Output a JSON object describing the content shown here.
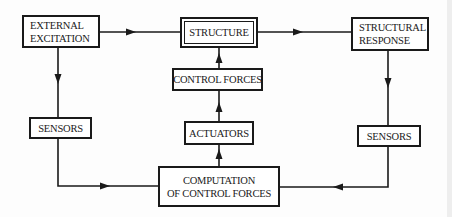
{
  "diagram": {
    "type": "block-diagram",
    "title": "",
    "nodes": {
      "external_excitation": {
        "lines": [
          "EXTERNAL",
          "EXCITATION"
        ]
      },
      "structure": {
        "lines": [
          "STRUCTURE"
        ],
        "style": "double-border"
      },
      "structural_response": {
        "lines": [
          "STRUCTURAL",
          "RESPONSE"
        ]
      },
      "control_forces": {
        "lines": [
          "CONTROL FORCES"
        ]
      },
      "actuators": {
        "lines": [
          "ACTUATORS"
        ]
      },
      "computation": {
        "lines": [
          "COMPUTATION",
          "OF CONTROL FORCES"
        ]
      },
      "sensors_left": {
        "lines": [
          "SENSORS"
        ]
      },
      "sensors_right": {
        "lines": [
          "SENSORS"
        ]
      }
    },
    "edges": [
      {
        "from": "EXTERNAL EXCITATION",
        "to": "STRUCTURE"
      },
      {
        "from": "STRUCTURE",
        "to": "STRUCTURAL RESPONSE"
      },
      {
        "from": "EXTERNAL EXCITATION",
        "to": "SENSORS (left)"
      },
      {
        "from": "SENSORS (left)",
        "to": "COMPUTATION OF CONTROL FORCES"
      },
      {
        "from": "STRUCTURAL RESPONSE",
        "to": "SENSORS (right)"
      },
      {
        "from": "SENSORS (right)",
        "to": "COMPUTATION OF CONTROL FORCES"
      },
      {
        "from": "COMPUTATION OF CONTROL FORCES",
        "to": "ACTUATORS"
      },
      {
        "from": "ACTUATORS",
        "to": "CONTROL FORCES"
      },
      {
        "from": "CONTROL FORCES",
        "to": "STRUCTURE"
      }
    ],
    "colors": {
      "line": "#1a1a1a",
      "background": "#fdfdfd"
    }
  }
}
